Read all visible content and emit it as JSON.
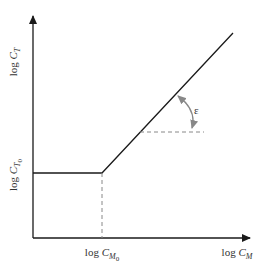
{
  "diagram": {
    "y_axis_label": {
      "prefix": "log ",
      "var": "C",
      "sub": "T"
    },
    "x_axis_label": {
      "prefix": "log ",
      "var": "C",
      "sub": "M"
    },
    "y_tick_label": {
      "prefix": "log ",
      "var": "C",
      "sub": "T",
      "subsub": "0"
    },
    "x_tick_label": {
      "prefix": "log ",
      "var": "C",
      "sub": "M",
      "subsub": "0"
    },
    "angle_label": "ε",
    "colors": {
      "axis": "#1a1a1a",
      "curve": "#1a1a1a",
      "dashed": "#888888",
      "arc": "#888888"
    }
  }
}
